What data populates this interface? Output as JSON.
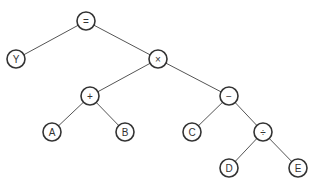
{
  "diagram": {
    "type": "expression-tree",
    "colors": {
      "edge": "#555555",
      "node_stroke": "#333333",
      "node_fill": "#ffffff",
      "text": "#333333"
    },
    "node_radius": 9,
    "nodes": [
      {
        "id": "eq",
        "label": "=",
        "x": 86,
        "y": 21
      },
      {
        "id": "Y",
        "label": "Y",
        "x": 16,
        "y": 59
      },
      {
        "id": "mul",
        "label": "×",
        "x": 158,
        "y": 59
      },
      {
        "id": "plus",
        "label": "+",
        "x": 90,
        "y": 96
      },
      {
        "id": "A",
        "label": "A",
        "x": 52,
        "y": 132
      },
      {
        "id": "B",
        "label": "B",
        "x": 125,
        "y": 132
      },
      {
        "id": "minus",
        "label": "−",
        "x": 229,
        "y": 96
      },
      {
        "id": "C",
        "label": "C",
        "x": 192,
        "y": 132
      },
      {
        "id": "div",
        "label": "÷",
        "x": 263,
        "y": 132
      },
      {
        "id": "D",
        "label": "D",
        "x": 229,
        "y": 168
      },
      {
        "id": "E",
        "label": "E",
        "x": 298,
        "y": 168
      }
    ],
    "edges": [
      [
        "eq",
        "Y"
      ],
      [
        "eq",
        "mul"
      ],
      [
        "mul",
        "plus"
      ],
      [
        "mul",
        "minus"
      ],
      [
        "plus",
        "A"
      ],
      [
        "plus",
        "B"
      ],
      [
        "minus",
        "C"
      ],
      [
        "minus",
        "div"
      ],
      [
        "div",
        "D"
      ],
      [
        "div",
        "E"
      ]
    ]
  }
}
